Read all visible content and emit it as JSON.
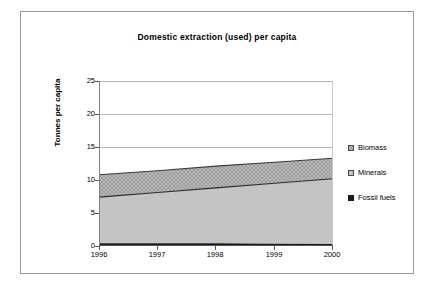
{
  "chart_data": {
    "type": "area",
    "stacked": true,
    "title": "Domestic extraction (used) per capita",
    "xlabel": "",
    "ylabel": "Tonnes per capita",
    "categories": [
      "1996",
      "1997",
      "1998",
      "1999",
      "2000"
    ],
    "x": [
      1996,
      1997,
      1998,
      1999,
      2000
    ],
    "ylim": [
      0,
      25
    ],
    "yticks": [
      0,
      5,
      10,
      15,
      20,
      25
    ],
    "ytick_labels": [
      "0",
      "5",
      "10",
      "15",
      "20",
      "25"
    ],
    "grid": "horizontal",
    "legend_position": "right",
    "series": [
      {
        "name": "Fossil fuels",
        "color": "#1a1a1a",
        "values": [
          0.4,
          0.4,
          0.4,
          0.35,
          0.3
        ]
      },
      {
        "name": "Minerals",
        "color": "#c4c4c4",
        "values": [
          7.0,
          7.7,
          8.4,
          9.15,
          9.9
        ]
      },
      {
        "name": "Biomass",
        "color": "#9a9a9a",
        "values": [
          3.4,
          3.3,
          3.3,
          3.2,
          3.1
        ]
      }
    ],
    "cumulative_tops": {
      "fossil_fuels": [
        0.4,
        0.4,
        0.4,
        0.35,
        0.3
      ],
      "minerals": [
        7.4,
        8.1,
        8.8,
        9.5,
        10.2
      ],
      "biomass": [
        10.8,
        11.4,
        12.1,
        12.7,
        13.3
      ]
    }
  },
  "chart": {
    "title": "Domestic extraction (used) per capita",
    "y_axis_title": "Tonnes per capita",
    "y_tick_labels": [
      "25",
      "20",
      "15",
      "10",
      "5",
      "0"
    ],
    "x_tick_labels": [
      "1996",
      "1997",
      "1998",
      "1999",
      "2000"
    ]
  },
  "legend": {
    "items": [
      {
        "label": "Biomass",
        "swatch": "biomass-swatch-icon"
      },
      {
        "label": "Minerals",
        "swatch": "minerals-swatch-icon"
      },
      {
        "label": "Fossil fuels",
        "swatch": "fossil-fuels-swatch-icon"
      }
    ]
  }
}
